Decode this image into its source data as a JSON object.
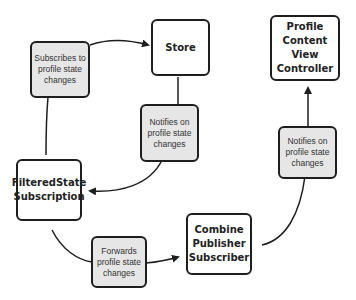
{
  "diagram": {
    "nodes": {
      "store": "Store",
      "profile_vc": "Profile Content View Controller",
      "filtered": "FilteredState Subscription",
      "combine": "Combine Publisher Subscriber"
    },
    "notes": {
      "subscribes": "Subscribes to profile state changes",
      "notifies_store": "Notifies on profile state changes",
      "forwards": "Forwards profile state changes",
      "notifies_vc": "Notifies on profile state changes"
    },
    "edges": [
      {
        "from": "FilteredState Subscription",
        "via": "Subscribes to profile state changes",
        "to": "Store"
      },
      {
        "from": "Store",
        "via": "Notifies on profile state changes",
        "to": "FilteredState Subscription"
      },
      {
        "from": "FilteredState Subscription",
        "via": "Forwards profile state changes",
        "to": "Combine Publisher Subscriber"
      },
      {
        "from": "Combine Publisher Subscriber",
        "via": "Notifies on profile state changes",
        "to": "Profile Content View Controller"
      }
    ],
    "colors": {
      "note_fill": "#e6e6e6",
      "stroke": "#1e1e1e"
    }
  }
}
